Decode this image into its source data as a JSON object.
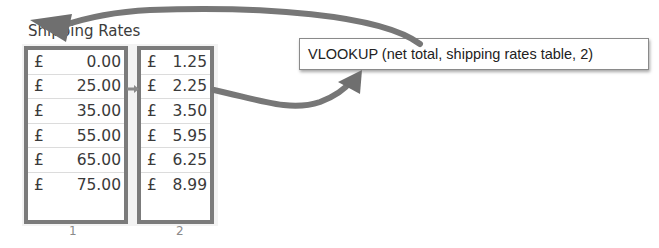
{
  "title": "Shipping Rates",
  "table": {
    "currency_symbol": "£",
    "column_1": {
      "label": "1",
      "values": [
        "0.00",
        "25.00",
        "35.00",
        "55.00",
        "65.00",
        "75.00"
      ]
    },
    "column_2": {
      "label": "2",
      "values": [
        "1.25",
        "2.25",
        "3.50",
        "5.95",
        "6.25",
        "8.99"
      ]
    }
  },
  "callout": {
    "text": "VLOOKUP (net total, shipping rates table, 2)"
  },
  "colors": {
    "box_border": "#7b7b7b",
    "arrow": "#777777",
    "text": "#3a3a3a"
  }
}
